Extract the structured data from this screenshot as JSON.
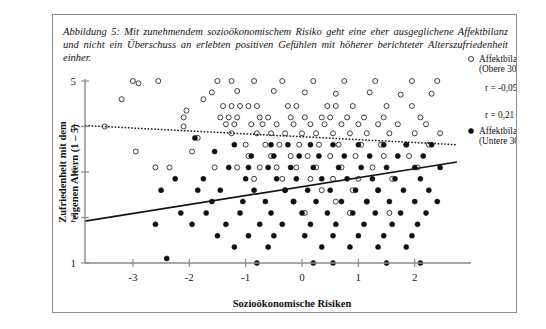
{
  "caption": {
    "label": "Abbildung 5:",
    "text": "Mit zunehmendem sozioökonomischem Risiko geht eine eher ausgeglichene Affektbilanz und nicht ein Überschuss an erlebten positiven Gefühlen mit höherer berichteter Alterszufriedenheit einher."
  },
  "chart_data": {
    "type": "scatter",
    "title": "",
    "xlabel": "Sozioökonomische Risiken",
    "ylabel": "Zufriedenheit mit dem eigenen Altern (1 – 5)",
    "xlim": [
      -3.85,
      2.75
    ],
    "ylim": [
      1,
      5
    ],
    "xticks": [
      -3,
      -2,
      -1,
      0,
      1,
      2
    ],
    "xticklabels": [
      "-3",
      "-2",
      "-1",
      "0",
      "1",
      "2"
    ],
    "yticks": [
      1,
      2,
      3,
      4,
      5
    ],
    "yticklabels": [
      "1",
      "2",
      "3",
      "4",
      "5"
    ],
    "grid": false,
    "legend_position": "right",
    "series": [
      {
        "name": "Affektbilanz (Obere 30%)",
        "marker": "open-circle",
        "r_label": "r = -0,09",
        "r_value": -0.09,
        "fit_line": {
          "style": "dotted",
          "x0": -3.85,
          "y0": 4.02,
          "x1": 2.75,
          "y1": 3.6
        },
        "points": [
          [
            -3.2,
            4.6
          ],
          [
            -2.55,
            5.0
          ],
          [
            -2.05,
            4.35
          ],
          [
            -2.1,
            4.2
          ],
          [
            -2.1,
            4.0
          ],
          [
            -2.35,
            3.1
          ],
          [
            -2.6,
            3.1
          ],
          [
            -1.85,
            3.75
          ],
          [
            -1.95,
            3.45
          ],
          [
            -2.9,
            4.95
          ],
          [
            -3.5,
            4.0
          ],
          [
            -1.5,
            5.0
          ],
          [
            -1.25,
            5.0
          ],
          [
            -0.85,
            5.0
          ],
          [
            -0.35,
            5.0
          ],
          [
            0.2,
            5.0
          ],
          [
            0.75,
            5.0
          ],
          [
            1.3,
            5.0
          ],
          [
            1.95,
            5.0
          ],
          [
            2.4,
            5.0
          ],
          [
            -1.6,
            4.75
          ],
          [
            -1.15,
            4.78
          ],
          [
            -0.5,
            4.78
          ],
          [
            0.05,
            4.75
          ],
          [
            0.6,
            4.72
          ],
          [
            1.2,
            4.75
          ],
          [
            1.75,
            4.7
          ],
          [
            2.3,
            4.72
          ],
          [
            -1.4,
            4.45
          ],
          [
            -1.25,
            4.45
          ],
          [
            -1.1,
            4.45
          ],
          [
            -0.95,
            4.45
          ],
          [
            -0.8,
            4.45
          ],
          [
            -0.25,
            4.45
          ],
          [
            -0.1,
            4.45
          ],
          [
            0.45,
            4.45
          ],
          [
            0.6,
            4.45
          ],
          [
            0.9,
            4.45
          ],
          [
            1.5,
            4.45
          ],
          [
            1.95,
            4.45
          ],
          [
            -1.45,
            4.2
          ],
          [
            -1.3,
            4.2
          ],
          [
            -1.15,
            4.2
          ],
          [
            -0.75,
            4.2
          ],
          [
            -0.6,
            4.2
          ],
          [
            -0.2,
            4.2
          ],
          [
            0.05,
            4.2
          ],
          [
            0.35,
            4.2
          ],
          [
            0.5,
            4.2
          ],
          [
            0.8,
            4.2
          ],
          [
            1.1,
            4.2
          ],
          [
            1.45,
            4.2
          ],
          [
            2.1,
            4.2
          ],
          [
            -1.35,
            4.05
          ],
          [
            -1.2,
            4.05
          ],
          [
            -0.9,
            4.05
          ],
          [
            -0.7,
            4.05
          ],
          [
            -0.45,
            4.05
          ],
          [
            -0.15,
            4.05
          ],
          [
            0.15,
            4.05
          ],
          [
            0.4,
            4.05
          ],
          [
            0.7,
            4.05
          ],
          [
            1.0,
            4.05
          ],
          [
            1.35,
            4.05
          ],
          [
            1.7,
            4.05
          ],
          [
            2.2,
            4.05
          ],
          [
            -1.25,
            3.85
          ],
          [
            -0.8,
            3.85
          ],
          [
            -0.55,
            3.85
          ],
          [
            -0.3,
            3.85
          ],
          [
            0.0,
            3.85
          ],
          [
            0.25,
            3.85
          ],
          [
            0.55,
            3.85
          ],
          [
            0.85,
            3.85
          ],
          [
            1.15,
            3.85
          ],
          [
            1.55,
            3.85
          ],
          [
            2.0,
            3.85
          ],
          [
            2.45,
            3.85
          ],
          [
            -1.0,
            3.6
          ],
          [
            -0.65,
            3.6
          ],
          [
            -0.4,
            3.6
          ],
          [
            -0.05,
            3.6
          ],
          [
            0.3,
            3.6
          ],
          [
            0.65,
            3.6
          ],
          [
            1.05,
            3.6
          ],
          [
            1.4,
            3.6
          ],
          [
            1.85,
            3.6
          ],
          [
            2.25,
            3.6
          ],
          [
            -0.95,
            3.35
          ],
          [
            -0.55,
            3.35
          ],
          [
            -0.2,
            3.35
          ],
          [
            0.1,
            3.35
          ],
          [
            0.5,
            3.35
          ],
          [
            0.95,
            3.35
          ],
          [
            1.45,
            3.35
          ],
          [
            1.9,
            3.35
          ],
          [
            -1.55,
            3.1
          ],
          [
            -1.15,
            3.1
          ],
          [
            -0.75,
            3.1
          ],
          [
            -0.45,
            3.1
          ],
          [
            -0.1,
            3.1
          ],
          [
            0.25,
            3.1
          ],
          [
            0.7,
            3.1
          ],
          [
            1.25,
            3.1
          ],
          [
            2.05,
            3.1
          ],
          [
            -0.85,
            2.85
          ],
          [
            -0.35,
            2.85
          ],
          [
            0.15,
            2.85
          ],
          [
            0.55,
            2.85
          ],
          [
            1.0,
            2.85
          ],
          [
            1.6,
            2.85
          ],
          [
            -0.3,
            2.6
          ],
          [
            0.35,
            2.6
          ],
          [
            0.9,
            2.6
          ],
          [
            1.35,
            2.6
          ],
          [
            -0.15,
            2.35
          ],
          [
            0.6,
            2.35
          ],
          [
            1.15,
            2.35
          ],
          [
            0.05,
            2.1
          ],
          [
            0.85,
            2.1
          ],
          [
            1.55,
            2.1
          ],
          [
            -2.95,
            3.45
          ],
          [
            -3.0,
            5.0
          ],
          [
            -1.75,
            4.6
          ]
        ]
      },
      {
        "name": "Affektbilanz (Untere 30%)",
        "marker": "filled-circle",
        "r_label": "r = 0,21",
        "r_value": 0.21,
        "fit_line": {
          "style": "solid",
          "x0": -3.85,
          "y0": 1.92,
          "x1": 2.75,
          "y1": 3.22
        },
        "points": [
          [
            -1.9,
            3.75
          ],
          [
            -1.55,
            3.45
          ],
          [
            -1.2,
            3.6
          ],
          [
            -0.55,
            3.6
          ],
          [
            -0.25,
            3.6
          ],
          [
            0.15,
            3.6
          ],
          [
            0.55,
            3.6
          ],
          [
            1.0,
            3.6
          ],
          [
            1.45,
            3.6
          ],
          [
            1.85,
            3.6
          ],
          [
            2.3,
            3.6
          ],
          [
            -0.9,
            3.35
          ],
          [
            -0.5,
            3.35
          ],
          [
            -0.05,
            3.35
          ],
          [
            0.3,
            3.35
          ],
          [
            0.75,
            3.35
          ],
          [
            1.2,
            3.35
          ],
          [
            1.7,
            3.35
          ],
          [
            2.15,
            3.35
          ],
          [
            -1.3,
            3.1
          ],
          [
            -0.95,
            3.1
          ],
          [
            -0.6,
            3.1
          ],
          [
            -0.2,
            3.1
          ],
          [
            0.2,
            3.1
          ],
          [
            0.65,
            3.1
          ],
          [
            1.05,
            3.1
          ],
          [
            1.5,
            3.1
          ],
          [
            2.0,
            3.1
          ],
          [
            2.45,
            3.1
          ],
          [
            -2.25,
            2.85
          ],
          [
            -1.75,
            2.85
          ],
          [
            -1.0,
            2.85
          ],
          [
            -0.45,
            2.85
          ],
          [
            -0.1,
            2.85
          ],
          [
            0.35,
            2.85
          ],
          [
            0.8,
            2.85
          ],
          [
            1.25,
            2.85
          ],
          [
            1.65,
            2.85
          ],
          [
            2.1,
            2.85
          ],
          [
            -2.5,
            2.6
          ],
          [
            -1.85,
            2.6
          ],
          [
            -1.45,
            2.6
          ],
          [
            -0.85,
            2.6
          ],
          [
            -0.3,
            2.6
          ],
          [
            0.1,
            2.6
          ],
          [
            0.5,
            2.6
          ],
          [
            0.95,
            2.6
          ],
          [
            1.35,
            2.6
          ],
          [
            1.8,
            2.6
          ],
          [
            2.25,
            2.6
          ],
          [
            -1.6,
            2.35
          ],
          [
            -1.05,
            2.35
          ],
          [
            -0.65,
            2.35
          ],
          [
            -0.15,
            2.35
          ],
          [
            0.25,
            2.35
          ],
          [
            0.7,
            2.35
          ],
          [
            1.15,
            2.35
          ],
          [
            1.55,
            2.35
          ],
          [
            2.0,
            2.35
          ],
          [
            2.4,
            2.35
          ],
          [
            -2.15,
            2.1
          ],
          [
            -1.7,
            2.1
          ],
          [
            -1.1,
            2.1
          ],
          [
            -0.55,
            2.1
          ],
          [
            0.0,
            2.1
          ],
          [
            0.45,
            2.1
          ],
          [
            0.9,
            2.1
          ],
          [
            1.3,
            2.1
          ],
          [
            1.75,
            2.1
          ],
          [
            2.2,
            2.1
          ],
          [
            -2.6,
            1.85
          ],
          [
            -1.95,
            1.85
          ],
          [
            -1.35,
            1.85
          ],
          [
            -0.75,
            1.85
          ],
          [
            -0.35,
            1.85
          ],
          [
            0.15,
            1.85
          ],
          [
            0.6,
            1.85
          ],
          [
            1.1,
            1.85
          ],
          [
            1.6,
            1.85
          ],
          [
            2.05,
            1.85
          ],
          [
            -1.5,
            1.6
          ],
          [
            -0.95,
            1.6
          ],
          [
            -0.5,
            1.6
          ],
          [
            0.05,
            1.6
          ],
          [
            0.55,
            1.6
          ],
          [
            1.0,
            1.6
          ],
          [
            1.45,
            1.6
          ],
          [
            1.95,
            1.6
          ],
          [
            -1.2,
            1.35
          ],
          [
            -0.6,
            1.35
          ],
          [
            0.35,
            1.35
          ],
          [
            0.85,
            1.35
          ],
          [
            1.35,
            1.35
          ],
          [
            1.85,
            1.35
          ],
          [
            -2.4,
            1.1
          ],
          [
            -0.8,
            1.0
          ],
          [
            0.55,
            1.0
          ],
          [
            1.5,
            1.0
          ],
          [
            2.1,
            1.0
          ],
          [
            0.2,
            1.0
          ]
        ]
      }
    ]
  },
  "legend": {
    "entries": [
      {
        "marker": "open-circle",
        "line1": "Affektbilanz",
        "line2": "(Obere 30%)",
        "r": "r = -0,09"
      },
      {
        "marker": "filled-circle",
        "line1": "Affektbilanz",
        "line2": "(Untere 30%)",
        "r": "r = 0,21"
      }
    ]
  },
  "colors": {
    "axis": "#8a8a8a",
    "marker": "#101010",
    "frame": "#8d8d8d",
    "text": "#141414"
  }
}
